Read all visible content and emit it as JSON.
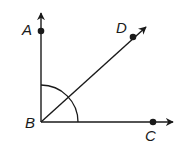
{
  "diagram": {
    "type": "angle-diagram",
    "vertex": {
      "label": "B",
      "x": 41,
      "y": 122,
      "label_x": 25,
      "label_y": 128
    },
    "points": [
      {
        "id": "A",
        "label": "A",
        "x": 41,
        "y": 31,
        "label_x": 22,
        "label_y": 35
      },
      {
        "id": "D",
        "label": "D",
        "x": 133,
        "y": 37,
        "label_x": 116,
        "label_y": 33
      },
      {
        "id": "C",
        "label": "C",
        "x": 153,
        "y": 122,
        "label_x": 145,
        "label_y": 141
      }
    ],
    "rays": [
      {
        "id": "BA",
        "from": "B",
        "through": "A",
        "end_x": 41,
        "end_y": 12
      },
      {
        "id": "BD",
        "from": "B",
        "through": "D",
        "end_x": 147,
        "end_y": 26
      },
      {
        "id": "BC",
        "from": "B",
        "through": "C",
        "end_x": 174,
        "end_y": 122
      }
    ],
    "angle_arc": {
      "center": "B",
      "radius": 37,
      "from_ray": "BA",
      "to_ray": "BC",
      "description": "right angle ABC marked with arc"
    },
    "colors": {
      "stroke": "#1a1a1a",
      "background": "#ffffff"
    }
  }
}
